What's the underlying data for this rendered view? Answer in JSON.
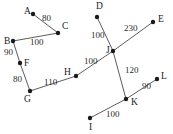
{
  "diagram": {
    "style": {
      "background": "#ffffff",
      "edge_color": "#4a4a4a",
      "vertex_color": "#1a1a1a",
      "text_color": "#1a1a1a"
    },
    "vertices": [
      {
        "id": "A",
        "label": "A",
        "x": 33,
        "y": 14,
        "label_x": 24,
        "label_y": 14
      },
      {
        "id": "C",
        "label": "C",
        "x": 58,
        "y": 33,
        "label_x": 62,
        "label_y": 29
      },
      {
        "id": "B",
        "label": "B",
        "x": 13,
        "y": 41,
        "label_x": 4,
        "label_y": 44
      },
      {
        "id": "F",
        "label": "F",
        "x": 20,
        "y": 63,
        "label_x": 24,
        "label_y": 66
      },
      {
        "id": "G",
        "label": "G",
        "x": 30,
        "y": 91,
        "label_x": 24,
        "label_y": 102
      },
      {
        "id": "H",
        "label": "H",
        "x": 76,
        "y": 76,
        "label_x": 64,
        "label_y": 75
      },
      {
        "id": "D",
        "label": "D",
        "x": 97,
        "y": 17,
        "label_x": 96,
        "label_y": 9
      },
      {
        "id": "E",
        "label": "E",
        "x": 153,
        "y": 22,
        "label_x": 158,
        "label_y": 22
      },
      {
        "id": "J",
        "label": "J",
        "x": 113,
        "y": 51,
        "label_x": 106,
        "label_y": 53
      },
      {
        "id": "K",
        "label": "K",
        "x": 126,
        "y": 99,
        "label_x": 131,
        "label_y": 105
      },
      {
        "id": "L",
        "label": "L",
        "x": 157,
        "y": 79,
        "label_x": 161,
        "label_y": 79
      },
      {
        "id": "I",
        "label": "I",
        "x": 90,
        "y": 118,
        "label_x": 89,
        "label_y": 130
      }
    ],
    "edges": [
      {
        "id": "A-C",
        "from": "A",
        "to": "C",
        "weight": "80",
        "weight_x": 42,
        "weight_y": 21
      },
      {
        "id": "C-B",
        "from": "C",
        "to": "B",
        "weight": "100",
        "weight_x": 30,
        "weight_y": 45
      },
      {
        "id": "B-F",
        "from": "B",
        "to": "F",
        "weight": "90",
        "weight_x": 4,
        "weight_y": 55
      },
      {
        "id": "F-G",
        "from": "F",
        "to": "G",
        "weight": "80",
        "weight_x": 13,
        "weight_y": 82
      },
      {
        "id": "G-H",
        "from": "G",
        "to": "H",
        "weight": "110",
        "weight_x": 44,
        "weight_y": 85
      },
      {
        "id": "H-J",
        "from": "H",
        "to": "J",
        "weight": "100",
        "weight_x": 84,
        "weight_y": 64
      },
      {
        "id": "D-J",
        "from": "D",
        "to": "J",
        "weight": "100",
        "weight_x": 91,
        "weight_y": 38
      },
      {
        "id": "J-E",
        "from": "J",
        "to": "E",
        "weight": "230",
        "weight_x": 124,
        "weight_y": 31
      },
      {
        "id": "J-K",
        "from": "J",
        "to": "K",
        "weight": "120",
        "weight_x": 125,
        "weight_y": 73
      },
      {
        "id": "I-K",
        "from": "I",
        "to": "K",
        "weight": "100",
        "weight_x": 106,
        "weight_y": 117
      },
      {
        "id": "K-L",
        "from": "K",
        "to": "L",
        "weight": "90",
        "weight_x": 142,
        "weight_y": 89
      }
    ]
  }
}
